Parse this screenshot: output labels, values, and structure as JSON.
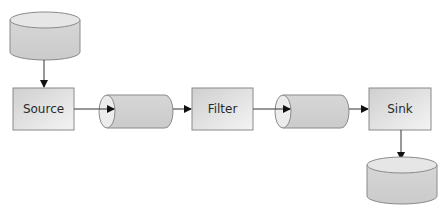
{
  "diagram": {
    "title": "",
    "nodes": [
      {
        "id": "source-db",
        "type": "database",
        "label": ""
      },
      {
        "id": "source",
        "type": "process",
        "label": "Source"
      },
      {
        "id": "pipe-1",
        "type": "pipe",
        "label": ""
      },
      {
        "id": "filter",
        "type": "process",
        "label": "Filter"
      },
      {
        "id": "pipe-2",
        "type": "pipe",
        "label": ""
      },
      {
        "id": "sink",
        "type": "process",
        "label": "Sink"
      },
      {
        "id": "sink-db",
        "type": "database",
        "label": ""
      }
    ],
    "edges": [
      {
        "from": "source-db",
        "to": "source"
      },
      {
        "from": "source",
        "to": "pipe-1"
      },
      {
        "from": "pipe-1",
        "to": "filter"
      },
      {
        "from": "filter",
        "to": "pipe-2"
      },
      {
        "from": "pipe-2",
        "to": "sink"
      },
      {
        "from": "sink",
        "to": "sink-db"
      }
    ],
    "colors": {
      "stroke": "#8a8a8a",
      "fill": "#d4d4d4",
      "fill_light": "#ececec",
      "arrow": "#111111"
    }
  },
  "labels": {
    "source": "Source",
    "filter": "Filter",
    "sink": "Sink"
  }
}
